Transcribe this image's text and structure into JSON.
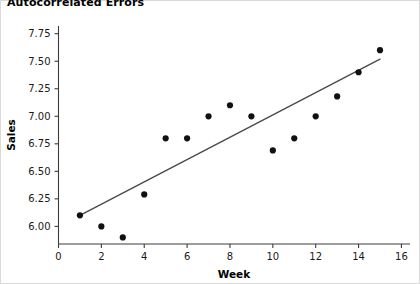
{
  "chart_data": {
    "type": "scatter",
    "title": "Autocorrelated Errors",
    "xlabel": "Week",
    "ylabel": "Sales",
    "xlim": [
      0,
      16.4
    ],
    "ylim": [
      5.84,
      7.82
    ],
    "grid": false,
    "legend": false,
    "xticks": [
      0,
      2,
      4,
      6,
      8,
      10,
      12,
      14,
      16
    ],
    "xtick_labels": [
      "0",
      "2",
      "4",
      "6",
      "8",
      "10",
      "12",
      "14",
      "16"
    ],
    "yticks": [
      6.0,
      6.25,
      6.5,
      6.75,
      7.0,
      7.25,
      7.5,
      7.75
    ],
    "ytick_labels": [
      "6.00",
      "6.25",
      "6.50",
      "6.75",
      "7.00",
      "7.25",
      "7.50",
      "7.75"
    ],
    "x": [
      1,
      2,
      3,
      4,
      5,
      6,
      7,
      8,
      9,
      10,
      11,
      12,
      13,
      14,
      15
    ],
    "y": [
      6.1,
      6.0,
      5.9,
      6.29,
      6.8,
      6.8,
      7.0,
      7.1,
      7.0,
      6.69,
      6.8,
      7.0,
      7.18,
      7.4,
      7.6
    ],
    "series": [
      {
        "name": "Sales",
        "type": "scatter",
        "marker": "circle",
        "color": "#111111",
        "values": [
          6.1,
          6.0,
          5.9,
          6.29,
          6.8,
          6.8,
          7.0,
          7.1,
          7.0,
          6.69,
          6.8,
          7.0,
          7.18,
          7.4,
          7.6
        ]
      },
      {
        "name": "Fitted regression line",
        "type": "line",
        "color": "#4a4a4a",
        "x": [
          1,
          15
        ],
        "values": [
          6.1,
          7.52
        ]
      }
    ],
    "annotations": []
  },
  "colors": {
    "marker": "#111111",
    "line": "#4a4a4a",
    "axis": "#3c3c3c",
    "frame": "#d9d9d9",
    "background": "#ffffff"
  }
}
